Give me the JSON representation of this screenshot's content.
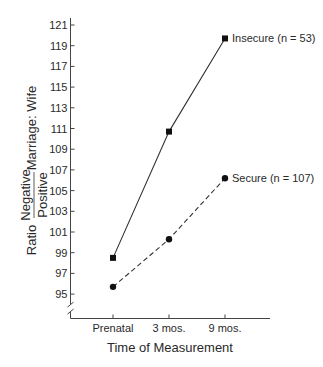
{
  "chart_data": {
    "type": "line",
    "title": "",
    "xlabel": "Time of Measurement",
    "ylabel": {
      "prefix": "Ratio",
      "fraction_numerator": "Negative",
      "fraction_denominator": "Positive",
      "suffix": "Marriage: Wife"
    },
    "categories": [
      "Prenatal",
      "3 mos.",
      "9 mos."
    ],
    "yticks": [
      95,
      97,
      99,
      101,
      103,
      105,
      107,
      109,
      111,
      113,
      115,
      117,
      119,
      121
    ],
    "ylim": [
      95,
      121
    ],
    "y_axis_break": true,
    "grid": false,
    "legend": "inline labels at line ends",
    "series": [
      {
        "name": "Insecure (n = 53)",
        "marker": "square",
        "line_style": "solid",
        "values": [
          98.5,
          110.7,
          119.7
        ]
      },
      {
        "name": "Secure (n = 107)",
        "marker": "circle",
        "line_style": "dashed",
        "values": [
          95.7,
          100.3,
          106.2
        ]
      }
    ],
    "colors": {
      "ink": "#222222",
      "background": "#ffffff"
    }
  }
}
